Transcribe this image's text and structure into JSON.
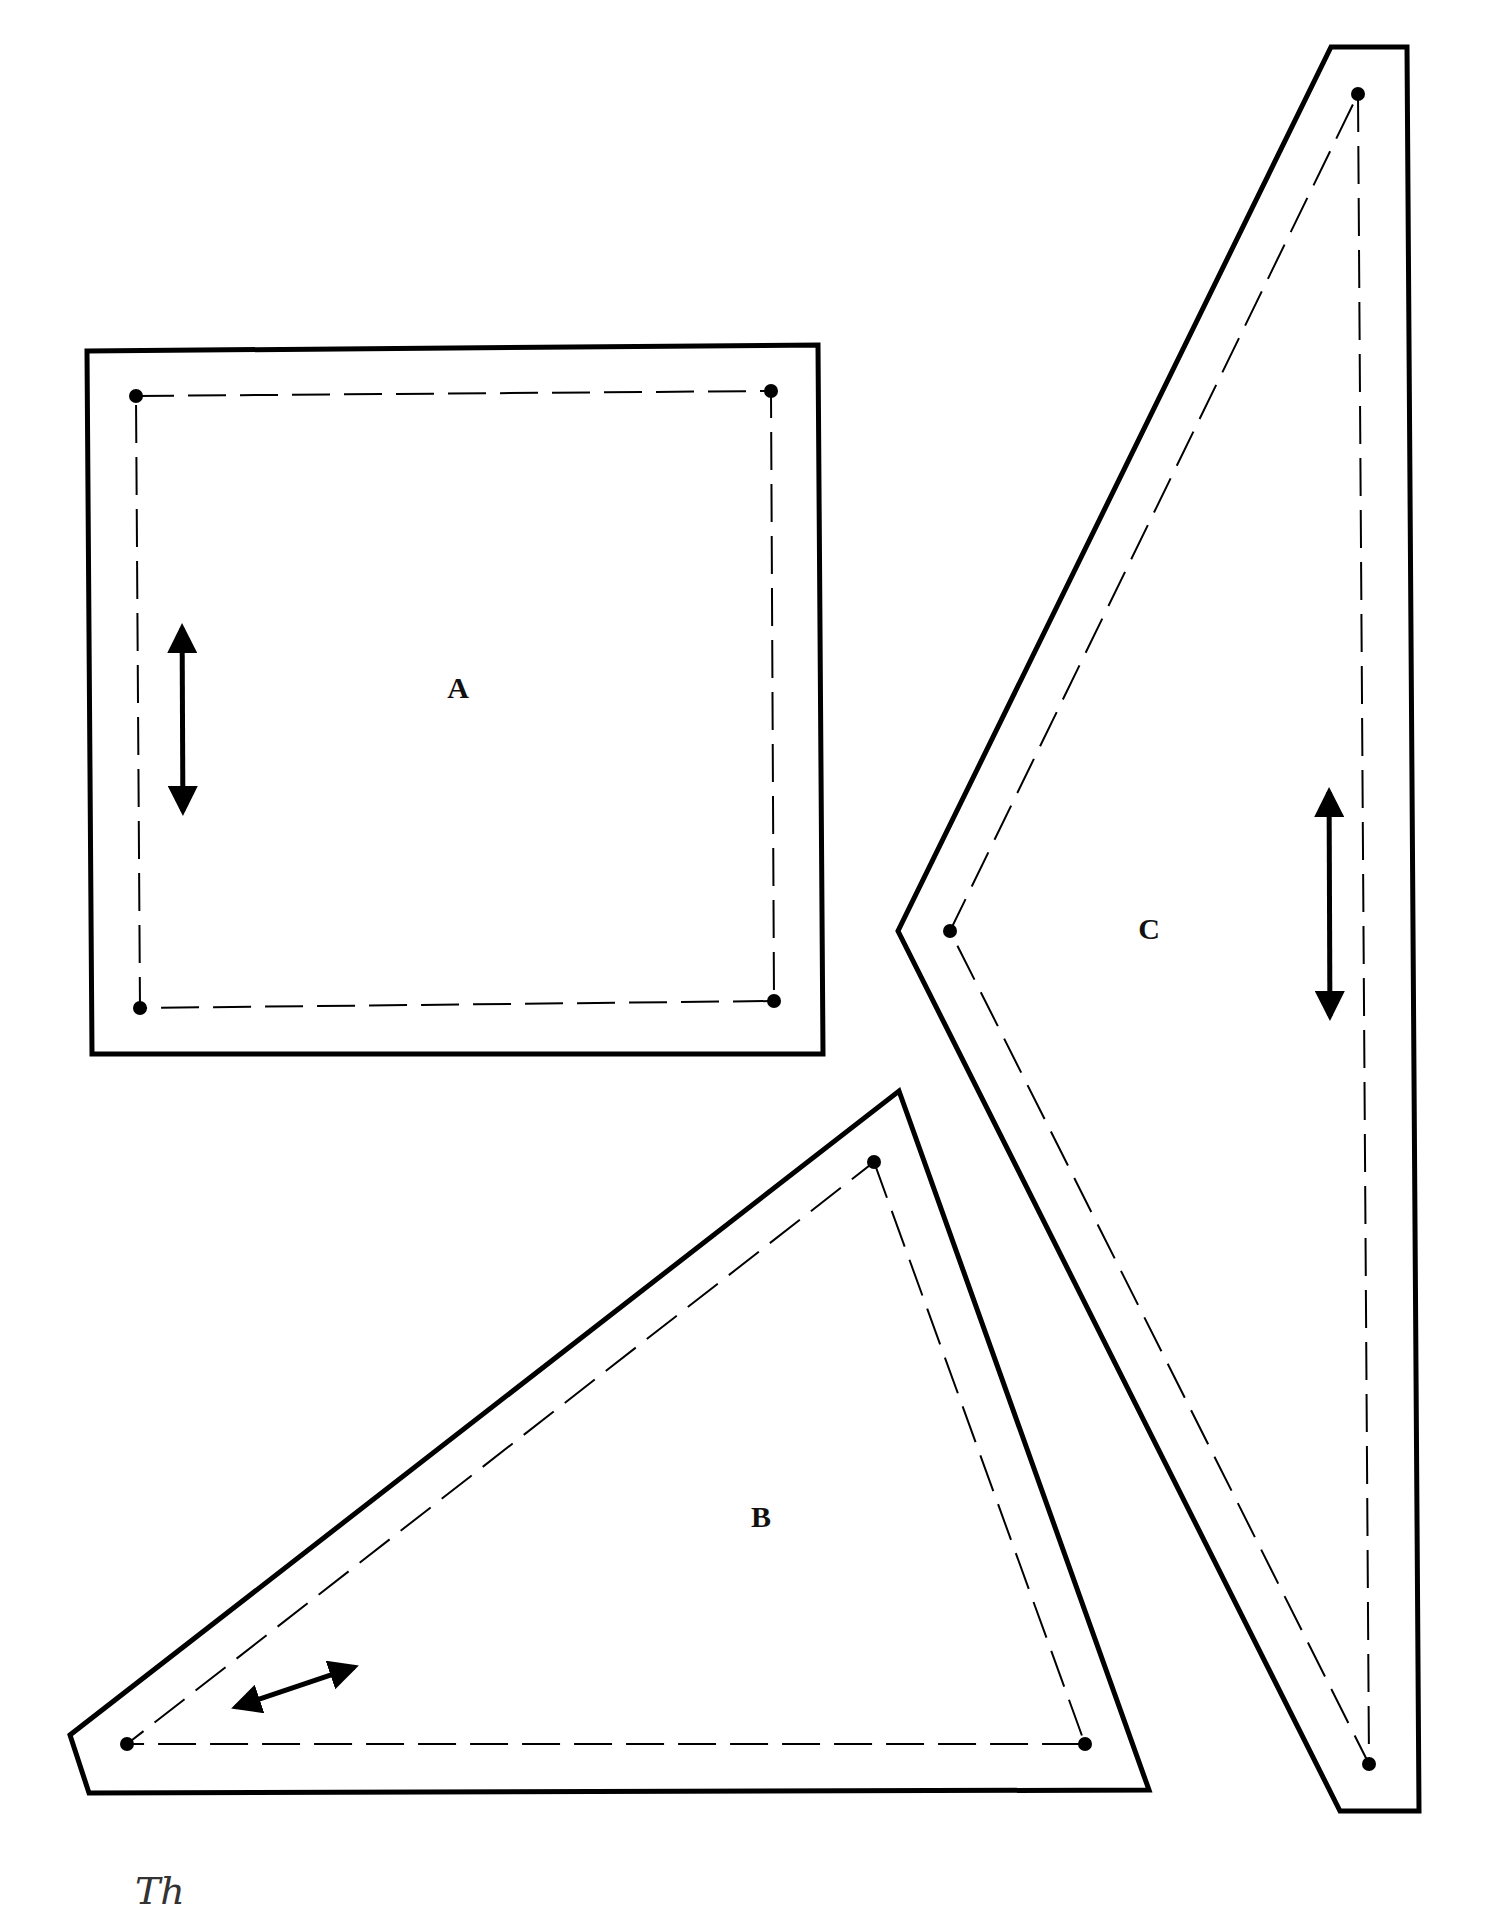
{
  "document": {
    "type": "quilt-template-sheet",
    "background": "#ffffff",
    "stroke_color": "#000000",
    "footer_mark": "Th"
  },
  "pieces": [
    {
      "label": "A",
      "shape": "square",
      "label_pos": [
        458,
        688
      ],
      "cut_line": [
        [
          87,
          351
        ],
        [
          818,
          345
        ],
        [
          823,
          1054
        ],
        [
          92,
          1054
        ]
      ],
      "seam_line": [
        [
          136,
          396
        ],
        [
          771,
          391
        ],
        [
          774,
          1001
        ],
        [
          140,
          1008
        ]
      ],
      "grain_arrow": [
        [
          182,
          606
        ],
        [
          183,
          833
        ]
      ]
    },
    {
      "label": "B",
      "shape": "triangle",
      "label_pos": [
        761,
        1517
      ],
      "cut_line": [
        [
          899,
          1091
        ],
        [
          1149,
          1790
        ],
        [
          89,
          1793
        ],
        [
          70,
          1735
        ]
      ],
      "seam_line": [
        [
          874,
          1162
        ],
        [
          1085,
          1744
        ],
        [
          127,
          1744
        ]
      ],
      "grain_arrow": [
        [
          215,
          1714
        ],
        [
          375,
          1660
        ]
      ]
    },
    {
      "label": "C",
      "shape": "triangle",
      "label_pos": [
        1149,
        929
      ],
      "cut_line": [
        [
          1331,
          47
        ],
        [
          1407,
          47
        ],
        [
          1419,
          1811
        ],
        [
          1340,
          1811
        ],
        [
          898,
          931
        ]
      ],
      "seam_line": [
        [
          1358,
          94
        ],
        [
          1369,
          1764
        ],
        [
          950,
          931
        ]
      ],
      "grain_arrow": [
        [
          1329,
          770
        ],
        [
          1330,
          1038
        ]
      ]
    }
  ]
}
